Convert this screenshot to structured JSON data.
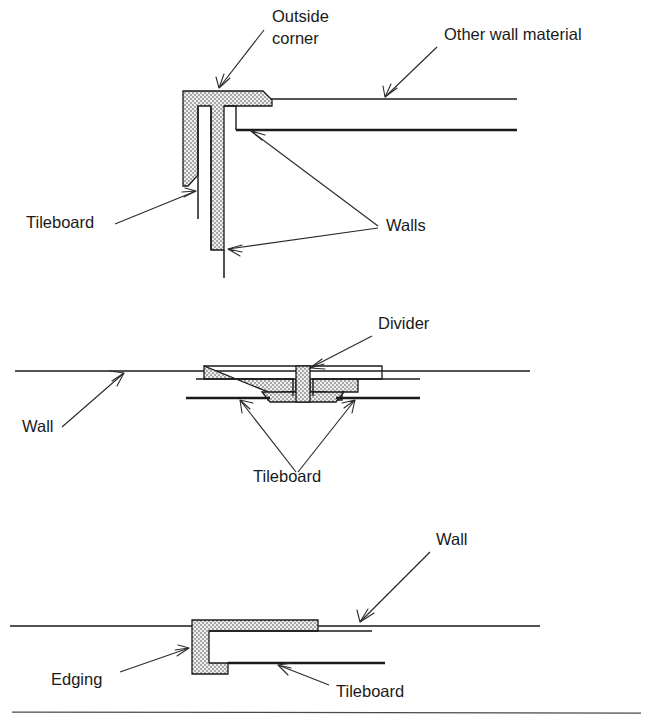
{
  "figure": {
    "width": 653,
    "height": 728,
    "background_color": "#ffffff",
    "line_color": "#1a1a1a",
    "fill_pattern_color": "#b9b9b9",
    "fill_pattern_background": "#efefef"
  },
  "panels": [
    {
      "id": "outside-corner",
      "name": "Outside corner detail",
      "labels": [
        {
          "key": "outside_corner",
          "text_line_1": "Outside",
          "text_line_2": "corner",
          "x": 272,
          "y": 22
        },
        {
          "key": "other_wall_material",
          "text": "Other wall material",
          "x": 444,
          "y": 40
        },
        {
          "key": "tileboard",
          "text": "Tileboard",
          "x": 26,
          "y": 228
        },
        {
          "key": "walls",
          "text": "Walls",
          "x": 386,
          "y": 231
        }
      ]
    },
    {
      "id": "divider",
      "name": "Divider detail",
      "labels": [
        {
          "key": "divider",
          "text": "Divider",
          "x": 378,
          "y": 329
        },
        {
          "key": "wall",
          "text": "Wall",
          "x": 22,
          "y": 432
        },
        {
          "key": "tileboard",
          "text": "Tileboard",
          "x": 253,
          "y": 482
        }
      ]
    },
    {
      "id": "edging",
      "name": "Edging detail",
      "labels": [
        {
          "key": "wall",
          "text": "Wall",
          "x": 436,
          "y": 545
        },
        {
          "key": "edging",
          "text": "Edging",
          "x": 51,
          "y": 728
        },
        {
          "key": "tileboard",
          "text": "Tileboard",
          "x": 336,
          "y": 740
        }
      ]
    }
  ],
  "labels_flat": {
    "outside_corner_line1": "Outside",
    "outside_corner_line2": "corner",
    "other_wall_material": "Other wall material",
    "tileboard_1": "Tileboard",
    "walls": "Walls",
    "divider": "Divider",
    "wall_2": "Wall",
    "tileboard_2": "Tileboard",
    "wall_3": "Wall",
    "edging": "Edging",
    "tileboard_3": "Tileboard"
  }
}
